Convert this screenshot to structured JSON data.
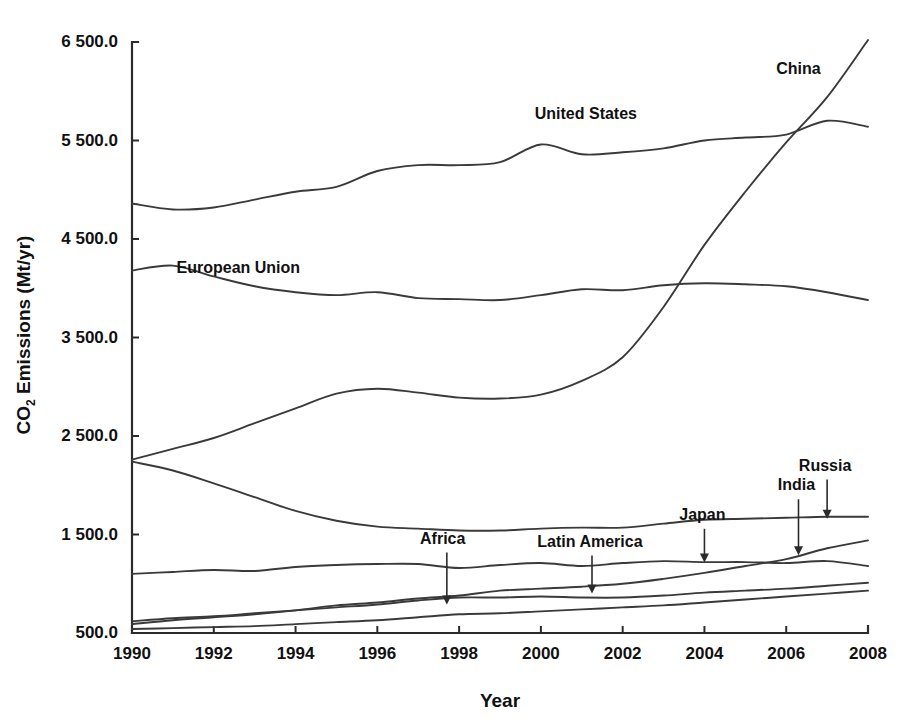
{
  "chart_data": {
    "type": "line",
    "title": "",
    "xlabel": "Year",
    "ylabel": "CO2 Emissions (Mt/yr)",
    "ylabel_parts": {
      "pre": "CO",
      "sub": "2",
      "post": " Emissions (Mt/yr)"
    },
    "xlim": [
      1990,
      2008
    ],
    "ylim": [
      500.0,
      6500.0
    ],
    "grid": false,
    "legend": "inline-labels",
    "xticks": [
      1990,
      1992,
      1994,
      1996,
      1998,
      2000,
      2002,
      2004,
      2006,
      2008
    ],
    "xtick_labels": [
      "1990",
      "1992",
      "1994",
      "1996",
      "1998",
      "2000",
      "2002",
      "2004",
      "2006",
      "2008"
    ],
    "yticks": [
      500.0,
      1500.0,
      2500.0,
      3500.0,
      4500.0,
      5500.0,
      6500.0
    ],
    "ytick_labels": [
      "500.0",
      "1 500.0",
      "2 500.0",
      "3 500.0",
      "4 500.0",
      "5 500.0",
      "6 500.0"
    ],
    "x": [
      1990,
      1991,
      1992,
      1993,
      1994,
      1995,
      1996,
      1997,
      1998,
      1999,
      2000,
      2001,
      2002,
      2003,
      2004,
      2005,
      2006,
      2007,
      2008
    ],
    "series": [
      {
        "name": "United States",
        "label": "United States",
        "label_type": "inline",
        "label_x": 2001.1,
        "label_y": 5760,
        "values": [
          4860,
          4800,
          4820,
          4900,
          4980,
          5030,
          5190,
          5250,
          5250,
          5280,
          5460,
          5360,
          5380,
          5420,
          5500,
          5530,
          5560,
          5700,
          5640
        ]
      },
      {
        "name": "European Union",
        "label": "European Union",
        "label_type": "inline",
        "label_x": 1992.6,
        "label_y": 4200,
        "values": [
          4180,
          4230,
          4120,
          4020,
          3960,
          3930,
          3960,
          3900,
          3890,
          3880,
          3930,
          3990,
          3980,
          4030,
          4050,
          4040,
          4020,
          3960,
          3880
        ]
      },
      {
        "name": "China",
        "label": "China",
        "label_type": "inline",
        "label_x": 2006.3,
        "label_y": 6220,
        "values": [
          2260,
          2370,
          2480,
          2630,
          2780,
          2930,
          2980,
          2940,
          2890,
          2880,
          2920,
          3060,
          3300,
          3810,
          4440,
          4980,
          5480,
          5940,
          6520
        ]
      },
      {
        "name": "Russia",
        "label": "Russia",
        "label_type": "arrow",
        "label_x": 2006.95,
        "label_y": 2190,
        "arrow_x": 2007.0,
        "arrow_tip_y": 1660,
        "values": [
          2240,
          2150,
          2020,
          1880,
          1740,
          1640,
          1580,
          1560,
          1540,
          1540,
          1560,
          1570,
          1570,
          1610,
          1650,
          1660,
          1670,
          1680,
          1680
        ]
      },
      {
        "name": "Japan",
        "label": "Japan",
        "label_type": "arrow",
        "label_x": 2003.95,
        "label_y": 1690,
        "arrow_x": 2004.0,
        "arrow_tip_y": 1215,
        "values": [
          1100,
          1120,
          1140,
          1130,
          1170,
          1190,
          1200,
          1200,
          1160,
          1190,
          1210,
          1180,
          1210,
          1230,
          1220,
          1220,
          1210,
          1230,
          1180
        ]
      },
      {
        "name": "India",
        "label": "India",
        "label_type": "arrow",
        "label_x": 2006.25,
        "label_y": 1990,
        "arrow_x": 2006.3,
        "arrow_tip_y": 1290,
        "values": [
          590,
          630,
          660,
          690,
          730,
          780,
          810,
          850,
          880,
          930,
          950,
          970,
          1000,
          1050,
          1110,
          1180,
          1250,
          1360,
          1440
        ]
      },
      {
        "name": "Latin America",
        "label": "Latin America",
        "label_type": "arrow",
        "label_x": 2001.2,
        "label_y": 1420,
        "arrow_x": 2001.25,
        "arrow_tip_y": 900,
        "values": [
          620,
          650,
          670,
          700,
          730,
          760,
          790,
          830,
          860,
          860,
          870,
          860,
          860,
          880,
          910,
          930,
          950,
          980,
          1010
        ]
      },
      {
        "name": "Africa",
        "label": "Africa",
        "label_type": "arrow",
        "label_x": 1997.6,
        "label_y": 1450,
        "arrow_x": 1997.7,
        "arrow_tip_y": 790,
        "values": [
          540,
          550,
          560,
          570,
          590,
          610,
          630,
          660,
          690,
          700,
          720,
          740,
          760,
          780,
          810,
          840,
          870,
          900,
          930
        ]
      }
    ]
  },
  "style": {
    "axis_color": "#2b2b2b",
    "line_color": "#3a3a3a",
    "background": "#ffffff",
    "text_color": "#111111"
  }
}
